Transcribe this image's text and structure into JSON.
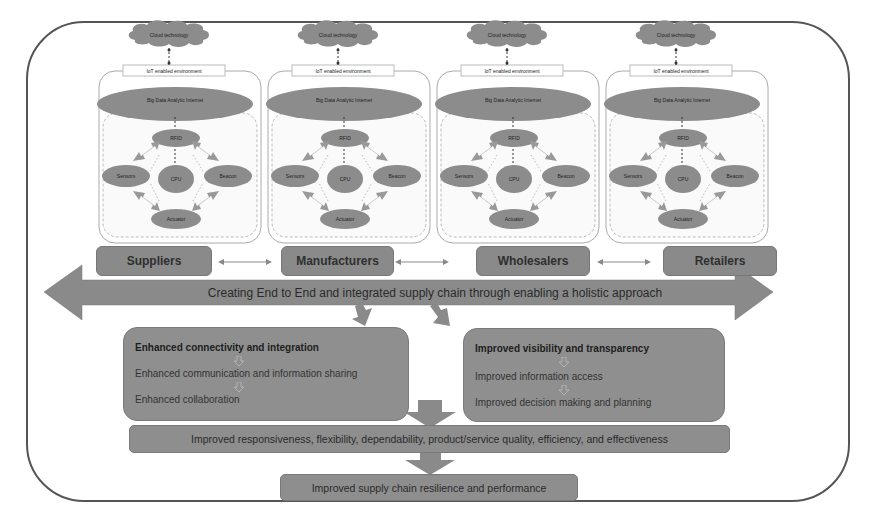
{
  "diagram": {
    "modules": [
      {
        "cloud": "Cloud technology",
        "iot": "IoT enabled environment",
        "big_data": "Big Data Analytic Internet",
        "nodes": {
          "top": "RFID",
          "left": "Sensors",
          "right": "Beacon",
          "bottom": "Actuator",
          "center": "CPU"
        }
      },
      {
        "cloud": "Cloud technology",
        "iot": "IoT enabled environment",
        "big_data": "Big Data Analytic Internet",
        "nodes": {
          "top": "RFID",
          "left": "Sensors",
          "right": "Beacon",
          "bottom": "Actuator",
          "center": "CPU"
        }
      },
      {
        "cloud": "Cloud technology",
        "iot": "IoT enabled environment",
        "big_data": "Big Data Analytic Internet",
        "nodes": {
          "top": "RFID",
          "left": "Sensors",
          "right": "Beacon",
          "bottom": "Actuator",
          "center": "CPU"
        }
      },
      {
        "cloud": "Cloud technology",
        "iot": "IoT enabled environment",
        "big_data": "Big Data Analytic Internet",
        "nodes": {
          "top": "RFID",
          "left": "Sensors",
          "right": "Beacon",
          "bottom": "Actuator",
          "center": "CPU"
        }
      }
    ],
    "stages": [
      "Suppliers",
      "Manufacturers",
      "Wholesalers",
      "Retailers"
    ],
    "banner": "Creating End to End and integrated supply chain through enabling a holistic approach",
    "panels": [
      {
        "title": "Enhanced connectivity and integration",
        "lines": [
          "Enhanced communication and information sharing",
          "Enhanced collaboration"
        ]
      },
      {
        "title": "Improved visibility and transparency",
        "lines": [
          "Improved information access",
          "Improved decision making and planning"
        ]
      }
    ],
    "outcome": "Improved responsiveness, flexibility, dependability, product/service quality, efficiency, and effectiveness",
    "final": "Improved supply chain resilience and performance",
    "colors": {
      "box_fill": "#8e8e8e",
      "arrow_fill": "#8a8a8a",
      "ellipse_fill": "#8c8c8c",
      "frame_stroke": "#555555"
    }
  }
}
